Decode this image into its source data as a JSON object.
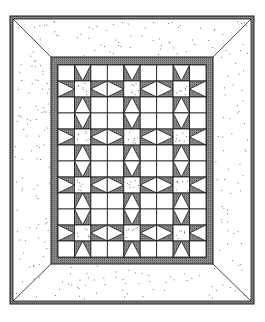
{
  "diagram": {
    "pattern_name": "Star blocks with diamond sashing",
    "layout": {
      "star_block_columns": 3,
      "star_block_rows": 4,
      "cells_per_block_side": 3,
      "grid_columns": 9,
      "grid_rows": 12
    },
    "borders": [
      "inner dark band",
      "outer speckled border with mitered corners",
      "outer dark binding"
    ],
    "colors": {
      "background": "#ffffff",
      "dark_fabric": "#8a8a8a",
      "dark_fabric_hatch": "#5a5a5a",
      "light_fabric": "#ffffff",
      "speckle_fabric": "#ffffff",
      "speckle_dot": "#555555",
      "line": "#1a1a1a"
    }
  }
}
